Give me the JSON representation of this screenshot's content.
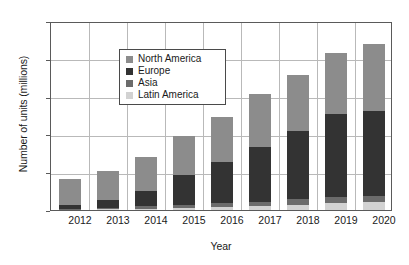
{
  "chart_data": {
    "type": "bar",
    "subtype": "stacked-vertical",
    "title": "",
    "xlabel": "Year",
    "ylabel": "Number of units (millions)",
    "categories": [
      "2012",
      "2013",
      "2014",
      "2015",
      "2016",
      "2017",
      "2018",
      "2019",
      "2020"
    ],
    "series": [
      {
        "name": "Latin America",
        "color": "#d2d2d2",
        "values": [
          1,
          1,
          2,
          3,
          4,
          5,
          7,
          9,
          10
        ]
      },
      {
        "name": "Asia",
        "color": "#6b6b6b",
        "values": [
          1,
          2,
          3,
          4,
          5,
          6,
          7,
          8,
          9
        ]
      },
      {
        "name": "Europe",
        "color": "#333333",
        "values": [
          4,
          10,
          20,
          39,
          55,
          73,
          90,
          110,
          112
        ]
      },
      {
        "name": "North America",
        "color": "#8c8c8c",
        "values": [
          35,
          38,
          45,
          52,
          59,
          69,
          75,
          81,
          89
        ]
      }
    ],
    "totals": [
      41,
      51,
      70,
      98,
      123,
      153,
      179,
      208,
      220
    ],
    "ylim": [
      0,
      250
    ],
    "yticks": [
      "0",
      "50",
      "100",
      "150",
      "200",
      "250"
    ],
    "grid": true,
    "legend_position": "upper-left-inside",
    "legend_entries": [
      "North America",
      "Europe",
      "Asia",
      "Latin America"
    ]
  }
}
